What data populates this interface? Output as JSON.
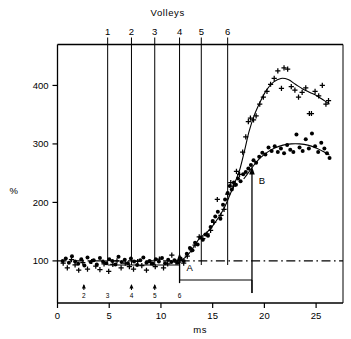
{
  "chart_data": {
    "type": "scatter",
    "title": "",
    "xlabel": "ms",
    "ylabel": "%",
    "top_axis_label": "Volleys",
    "xlim": [
      0,
      27.6
    ],
    "ylim": [
      28,
      470
    ],
    "grid": false,
    "legend_position": "none",
    "x_ticks": [
      0,
      5,
      10,
      15,
      20,
      25
    ],
    "x_tick_labels": [
      "0",
      "5",
      "10",
      "15",
      "20",
      "25"
    ],
    "y_ticks": [
      100,
      200,
      300,
      400
    ],
    "y_tick_labels": [
      "100",
      "200",
      "300",
      "400"
    ],
    "reference_line": {
      "y": 100,
      "style": "dash-dot",
      "label": ""
    },
    "volley_lines": [
      {
        "label": "1",
        "x": 4.85
      },
      {
        "label": "2",
        "x": 7.15
      },
      {
        "label": "3",
        "x": 9.4
      },
      {
        "label": "4",
        "x": 11.8
      },
      {
        "label": "5",
        "x": 13.9
      },
      {
        "label": "6",
        "x": 16.45
      }
    ],
    "stimulus_markers": [
      {
        "label": "2",
        "x": 2.55
      },
      {
        "label": "3",
        "x": 4.85
      },
      {
        "label": "4",
        "x": 7.15
      },
      {
        "label": "5",
        "x": 9.4
      },
      {
        "label": "6",
        "x": 11.8
      }
    ],
    "annotations": [
      {
        "label": "A",
        "x": 11.8,
        "y_from": 62,
        "y_to": 104
      },
      {
        "label": "B",
        "x": 18.8,
        "y_from": 45,
        "y_to": 252
      }
    ],
    "series": [
      {
        "name": "crosses",
        "marker": "plus",
        "color": "#000000",
        "points": [
          [
            0.55,
            96
          ],
          [
            0.95,
            88
          ],
          [
            1.35,
            102
          ],
          [
            1.7,
            93
          ],
          [
            2.05,
            84
          ],
          [
            2.45,
            97
          ],
          [
            2.9,
            86
          ],
          [
            3.3,
            99
          ],
          [
            3.7,
            91
          ],
          [
            4.1,
            85
          ],
          [
            4.5,
            95
          ],
          [
            4.95,
            82
          ],
          [
            5.35,
            94
          ],
          [
            5.75,
            100
          ],
          [
            6.15,
            88
          ],
          [
            6.55,
            96
          ],
          [
            6.95,
            90
          ],
          [
            7.35,
            86
          ],
          [
            7.75,
            99
          ],
          [
            8.15,
            92
          ],
          [
            8.6,
            84
          ],
          [
            9.0,
            97
          ],
          [
            9.45,
            90
          ],
          [
            9.85,
            103
          ],
          [
            10.25,
            88
          ],
          [
            10.65,
            95
          ],
          [
            11.05,
            110
          ],
          [
            11.45,
            98
          ],
          [
            11.85,
            101
          ],
          [
            12.2,
            96
          ],
          [
            12.55,
            108
          ],
          [
            12.95,
            119
          ],
          [
            13.3,
            127
          ],
          [
            13.7,
            141
          ],
          [
            14.05,
            138
          ],
          [
            14.45,
            146
          ],
          [
            14.8,
            152
          ],
          [
            15.1,
            166
          ],
          [
            15.45,
            205
          ],
          [
            15.8,
            178
          ],
          [
            16.1,
            188
          ],
          [
            16.45,
            214
          ],
          [
            16.75,
            234
          ],
          [
            17.0,
            228
          ],
          [
            17.3,
            253
          ],
          [
            17.6,
            248
          ],
          [
            17.9,
            286
          ],
          [
            18.2,
            312
          ],
          [
            18.45,
            338
          ],
          [
            18.65,
            344
          ],
          [
            18.95,
            341
          ],
          [
            19.2,
            348
          ],
          [
            19.55,
            368
          ],
          [
            19.9,
            380
          ],
          [
            20.25,
            390
          ],
          [
            20.6,
            402
          ],
          [
            20.95,
            412
          ],
          [
            21.3,
            425
          ],
          [
            21.65,
            395
          ],
          [
            21.9,
            430
          ],
          [
            22.25,
            428
          ],
          [
            22.6,
            398
          ],
          [
            22.95,
            392
          ],
          [
            23.3,
            380
          ],
          [
            23.65,
            388
          ],
          [
            24.0,
            396
          ],
          [
            24.35,
            352
          ],
          [
            24.55,
            352
          ],
          [
            24.9,
            390
          ],
          [
            25.25,
            382
          ],
          [
            25.6,
            400
          ],
          [
            25.95,
            368
          ],
          [
            26.2,
            374
          ]
        ]
      },
      {
        "name": "dots",
        "marker": "circle",
        "color": "#000000",
        "points": [
          [
            0.5,
            100
          ],
          [
            0.8,
            104
          ],
          [
            1.1,
            97
          ],
          [
            1.4,
            108
          ],
          [
            1.7,
            99
          ],
          [
            2.0,
            95
          ],
          [
            2.3,
            103
          ],
          [
            2.6,
            92
          ],
          [
            2.9,
            106
          ],
          [
            3.2,
            98
          ],
          [
            3.5,
            101
          ],
          [
            3.8,
            94
          ],
          [
            4.1,
            105
          ],
          [
            4.4,
            99
          ],
          [
            4.7,
            96
          ],
          [
            5.0,
            103
          ],
          [
            5.3,
            100
          ],
          [
            5.6,
            94
          ],
          [
            5.9,
            107
          ],
          [
            6.2,
            98
          ],
          [
            6.5,
            102
          ],
          [
            6.8,
            96
          ],
          [
            7.1,
            104
          ],
          [
            7.4,
            99
          ],
          [
            7.7,
            93
          ],
          [
            8.0,
            101
          ],
          [
            8.3,
            106
          ],
          [
            8.6,
            97
          ],
          [
            8.9,
            100
          ],
          [
            9.2,
            95
          ],
          [
            9.5,
            103
          ],
          [
            9.8,
            99
          ],
          [
            10.1,
            105
          ],
          [
            10.4,
            96
          ],
          [
            10.7,
            102
          ],
          [
            11.0,
            98
          ],
          [
            11.3,
            101
          ],
          [
            11.6,
            97
          ],
          [
            11.9,
            104
          ],
          [
            12.2,
            100
          ],
          [
            12.5,
            112
          ],
          [
            12.8,
            122
          ],
          [
            13.05,
            118
          ],
          [
            13.3,
            131
          ],
          [
            13.55,
            128
          ],
          [
            13.8,
            140
          ],
          [
            14.05,
            136
          ],
          [
            14.3,
            145
          ],
          [
            14.55,
            143
          ],
          [
            14.8,
            158
          ],
          [
            15.0,
            168
          ],
          [
            15.25,
            176
          ],
          [
            15.5,
            184
          ],
          [
            15.75,
            172
          ],
          [
            16.0,
            196
          ],
          [
            16.2,
            205
          ],
          [
            16.45,
            216
          ],
          [
            16.65,
            228
          ],
          [
            16.85,
            222
          ],
          [
            17.05,
            234
          ],
          [
            17.25,
            230
          ],
          [
            17.45,
            241
          ],
          [
            17.7,
            236
          ],
          [
            17.95,
            248
          ],
          [
            18.2,
            252
          ],
          [
            18.45,
            258
          ],
          [
            18.7,
            264
          ],
          [
            18.95,
            272
          ],
          [
            19.2,
            268
          ],
          [
            19.5,
            278
          ],
          [
            19.8,
            285
          ],
          [
            20.1,
            282
          ],
          [
            20.4,
            294
          ],
          [
            20.7,
            288
          ],
          [
            21.0,
            296
          ],
          [
            21.3,
            286
          ],
          [
            21.6,
            292
          ],
          [
            21.9,
            284
          ],
          [
            22.2,
            298
          ],
          [
            22.5,
            290
          ],
          [
            22.8,
            286
          ],
          [
            23.1,
            316
          ],
          [
            23.4,
            294
          ],
          [
            23.7,
            288
          ],
          [
            24.0,
            308
          ],
          [
            24.3,
            292
          ],
          [
            24.6,
            318
          ],
          [
            24.9,
            296
          ],
          [
            25.2,
            286
          ],
          [
            25.5,
            302
          ],
          [
            25.8,
            292
          ],
          [
            26.05,
            284
          ],
          [
            26.3,
            276
          ]
        ]
      }
    ],
    "fit_curves": [
      {
        "name": "crosses-fit",
        "points": [
          [
            11.9,
            100
          ],
          [
            12.6,
            110
          ],
          [
            13.2,
            125
          ],
          [
            13.8,
            140
          ],
          [
            14.4,
            148
          ],
          [
            15.0,
            160
          ],
          [
            15.6,
            175
          ],
          [
            16.1,
            190
          ],
          [
            16.6,
            210
          ],
          [
            17.1,
            232
          ],
          [
            17.6,
            255
          ],
          [
            18.1,
            290
          ],
          [
            18.5,
            320
          ],
          [
            19.0,
            348
          ],
          [
            19.6,
            372
          ],
          [
            20.2,
            392
          ],
          [
            20.9,
            406
          ],
          [
            21.6,
            412
          ],
          [
            22.3,
            410
          ],
          [
            23.0,
            402
          ],
          [
            23.7,
            394
          ],
          [
            24.4,
            388
          ],
          [
            25.1,
            382
          ],
          [
            25.8,
            374
          ],
          [
            26.3,
            368
          ]
        ]
      },
      {
        "name": "dots-fit",
        "points": [
          [
            18.0,
            240
          ],
          [
            18.5,
            252
          ],
          [
            19.0,
            264
          ],
          [
            19.6,
            276
          ],
          [
            20.3,
            286
          ],
          [
            21.0,
            293
          ],
          [
            21.8,
            298
          ],
          [
            22.6,
            300
          ],
          [
            23.4,
            300
          ],
          [
            24.2,
            298
          ],
          [
            25.0,
            293
          ],
          [
            25.7,
            287
          ],
          [
            26.3,
            281
          ]
        ]
      }
    ]
  }
}
